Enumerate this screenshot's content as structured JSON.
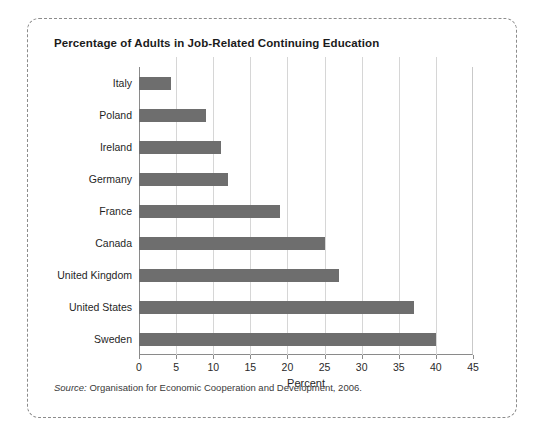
{
  "figure": {
    "title": "Percentage of Adults in Job-Related Continuing Education",
    "source_word": "Source:",
    "source_text": " Organisation for Economic Cooperation and Development, 2006.",
    "border_color": "#8c8c8c",
    "bar_color": "#6e6e6e",
    "grid_color": "#d6d6d6",
    "axis_color": "#8a8a8a"
  },
  "chart_data": {
    "type": "bar",
    "orientation": "horizontal",
    "title": "Percentage of Adults in Job-Related Continuing Education",
    "xlabel": "Percent",
    "ylabel": "",
    "categories": [
      "Italy",
      "Poland",
      "Ireland",
      "Germany",
      "France",
      "Canada",
      "United Kingdom",
      "United States",
      "Sweden"
    ],
    "values": [
      4.3,
      9,
      11,
      12,
      19,
      25,
      27,
      37,
      40
    ],
    "xlim": [
      0,
      45
    ],
    "xticks": [
      0,
      5,
      10,
      15,
      20,
      25,
      30,
      35,
      40,
      45
    ],
    "xtick_labels": [
      "0",
      "5",
      "10",
      "15",
      "20",
      "25",
      "30",
      "35",
      "40",
      "45"
    ],
    "grid": "vertical",
    "legend": "none",
    "series": [
      {
        "name": "Percent of adults",
        "values": [
          4.3,
          9,
          11,
          12,
          19,
          25,
          27,
          37,
          40
        ]
      }
    ]
  }
}
